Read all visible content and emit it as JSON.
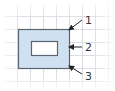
{
  "diagram": {
    "type": "labeled-figure",
    "grid": {
      "spacing": 13,
      "color": "#d8dde3",
      "vertical_lines_x": [
        17,
        30,
        43,
        56,
        69,
        82,
        95,
        108
      ],
      "horizontal_lines_y": [
        16,
        29,
        42,
        55,
        68,
        81
      ]
    },
    "outer_rect": {
      "x": 18,
      "y": 29,
      "width": 51,
      "height": 39,
      "fill": "#cfe0f0",
      "stroke": "#5a6370"
    },
    "inner_rect": {
      "x": 31,
      "y": 41,
      "width": 26,
      "height": 14,
      "fill": "#ffffff",
      "stroke": "#5a6370"
    },
    "callouts": [
      {
        "label": "1",
        "label_x": 85,
        "label_y": 24,
        "line_from": [
          82,
          20
        ],
        "arrow_to": [
          69,
          30
        ]
      },
      {
        "label": "2",
        "label_x": 85,
        "label_y": 51,
        "line_from": [
          82,
          47
        ],
        "arrow_to": [
          69,
          47
        ]
      },
      {
        "label": "3",
        "label_x": 85,
        "label_y": 80,
        "line_from": [
          82,
          74
        ],
        "arrow_to": [
          69,
          66
        ]
      }
    ]
  }
}
